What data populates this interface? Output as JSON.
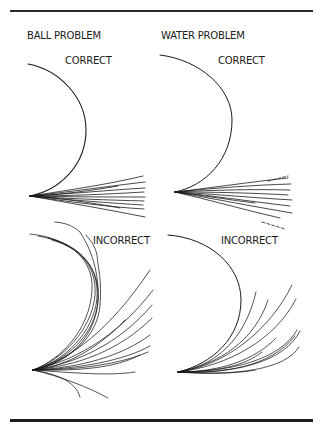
{
  "figure": {
    "columns": [
      {
        "title": "BALL PROBLEM"
      },
      {
        "title": "WATER PROBLEM"
      }
    ],
    "panels": {
      "ball_correct": {
        "label": "CORRECT"
      },
      "water_correct": {
        "label": "CORRECT"
      },
      "ball_incorrect": {
        "label": "INCORRECT"
      },
      "water_incorrect": {
        "label": "INCORRECT"
      }
    }
  },
  "paths": {
    "ball_correct_arc": "M28,64 C60,70 86,98 86,130 C86,165 60,190 30,196",
    "ball_correct_fan": [
      "M30,196 C70,190 110,184 143,176",
      "M30,196 C70,192 110,186 145,182",
      "M30,196 C70,194 110,190 145,188",
      "M30,196 C70,196 110,194 144,192",
      "M30,196 C70,197 110,197 145,197",
      "M30,196 C70,199 110,200 144,201",
      "M30,196 C70,200 110,203 143,205",
      "M30,196 C70,202 110,207 144,209",
      "M30,196 C70,203 110,210 145,217",
      "M30,196 C60,198 100,204 120,208",
      "M30,196 C60,195 95,190 118,186"
    ],
    "water_correct_arc": "M160,55 C200,60 232,88 232,120 C232,160 205,186 175,192",
    "water_correct_fan": [
      "M175,192 C210,188 250,182 288,178",
      "M175,192 C215,188 255,185 291,184",
      "M175,192 C215,190 255,189 290,190",
      "M175,192 C215,192 255,193 288,195",
      "M175,192 C215,194 255,198 292,200",
      "M175,192 C215,196 255,202 290,206",
      "M175,192 C210,198 250,206 292,213",
      "M175,192 C210,200 245,210 280,218",
      "M175,192 C200,195 230,200 255,203"
    ],
    "water_correct_dash": "M268,181 L288,176",
    "ball_incorrect_fan": [
      "M33,370 C60,360 90,330 92,290 C94,260 70,238 30,234",
      "M33,370 C62,360 92,330 95,295 C97,265 78,243 38,236",
      "M33,370 C64,362 94,332 97,298 C99,268 82,246 48,238",
      "M33,370 C66,362 96,334 98,300 C100,272 86,250 52,240",
      "M33,370 C70,362 98,336 100,305 C102,280 98,268 97,255 C95,245 90,240 86,235",
      "M33,370 C70,363 96,336 98,300 C99,280 95,255 80,232 C72,225 65,223 55,222",
      "M33,370 C70,360 110,330 150,270",
      "M33,370 C70,362 115,340 153,290",
      "M33,370 C75,364 118,345 152,305",
      "M33,370 C78,366 120,350 152,318",
      "M33,370 C80,368 122,356 150,335",
      "M33,370 C80,369 125,360 150,346",
      "M33,370 C80,370 120,364 148,352",
      "M33,370 C80,371 115,368 140,355",
      "M33,370 C75,373 110,376 135,372",
      "M33,370 C55,374 75,380 80,397",
      "M33,370 C60,376 90,388 108,398",
      "M33,370 C60,368 95,352 125,320"
    ],
    "water_incorrect_arc": "M168,235 C210,238 241,266 241,300 C241,338 212,364 178,372",
    "water_incorrect_fan": [
      "M178,372 C215,366 245,340 256,292",
      "M178,372 C220,364 255,340 268,300",
      "M178,372 C225,366 270,330 292,285",
      "M178,372 C228,366 275,340 296,299",
      "M178,372 C230,372 280,360 297,330",
      "M178,372 C235,374 285,362 300,331",
      "M178,372 C235,376 285,370 299,347",
      "M178,372 C220,372 255,360 276,338",
      "M178,372 C215,372 245,366 262,352",
      "M178,372 C220,374 270,368 295,336",
      "M178,372 C205,374 235,374 255,370"
    ],
    "water_incorrect_dash": "M262,222 L285,229"
  }
}
